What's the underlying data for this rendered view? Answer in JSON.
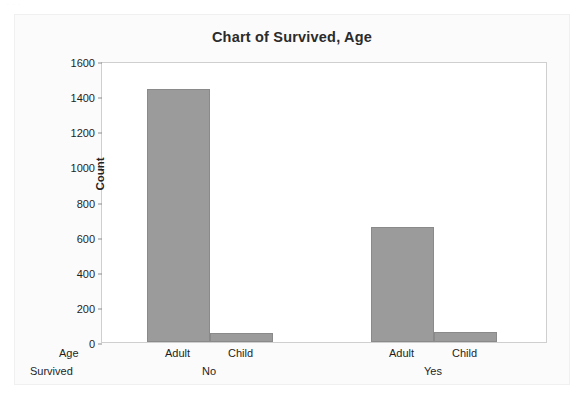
{
  "artifacts": {
    "top_left_smudge": "· · ·",
    "bleed_through_text": "Pie Cha"
  },
  "chart_data": {
    "type": "bar",
    "title": "Chart of Survived, Age",
    "xlabel": "",
    "ylabel": "Count",
    "ylim": [
      0,
      1600
    ],
    "ytick_step": 200,
    "yticks": [
      0,
      200,
      400,
      600,
      800,
      1000,
      1200,
      1400,
      1600
    ],
    "ytick_labels": [
      "0",
      "200",
      "400",
      "600",
      "800",
      "1000",
      "1200",
      "1400",
      "1600"
    ],
    "grid": false,
    "legend": "none",
    "bar_color": "#9b9b9b",
    "axis_row_titles": [
      "Age",
      "Survived"
    ],
    "groups": [
      {
        "label": "No",
        "categories": [
          "Adult",
          "Child"
        ],
        "values": [
          1438,
          52
        ]
      },
      {
        "label": "Yes",
        "categories": [
          "Adult",
          "Child"
        ],
        "values": [
          654,
          57
        ]
      }
    ],
    "categories": [
      "Adult",
      "Child",
      "Adult",
      "Child"
    ],
    "values": [
      1438,
      52,
      654,
      57
    ]
  }
}
